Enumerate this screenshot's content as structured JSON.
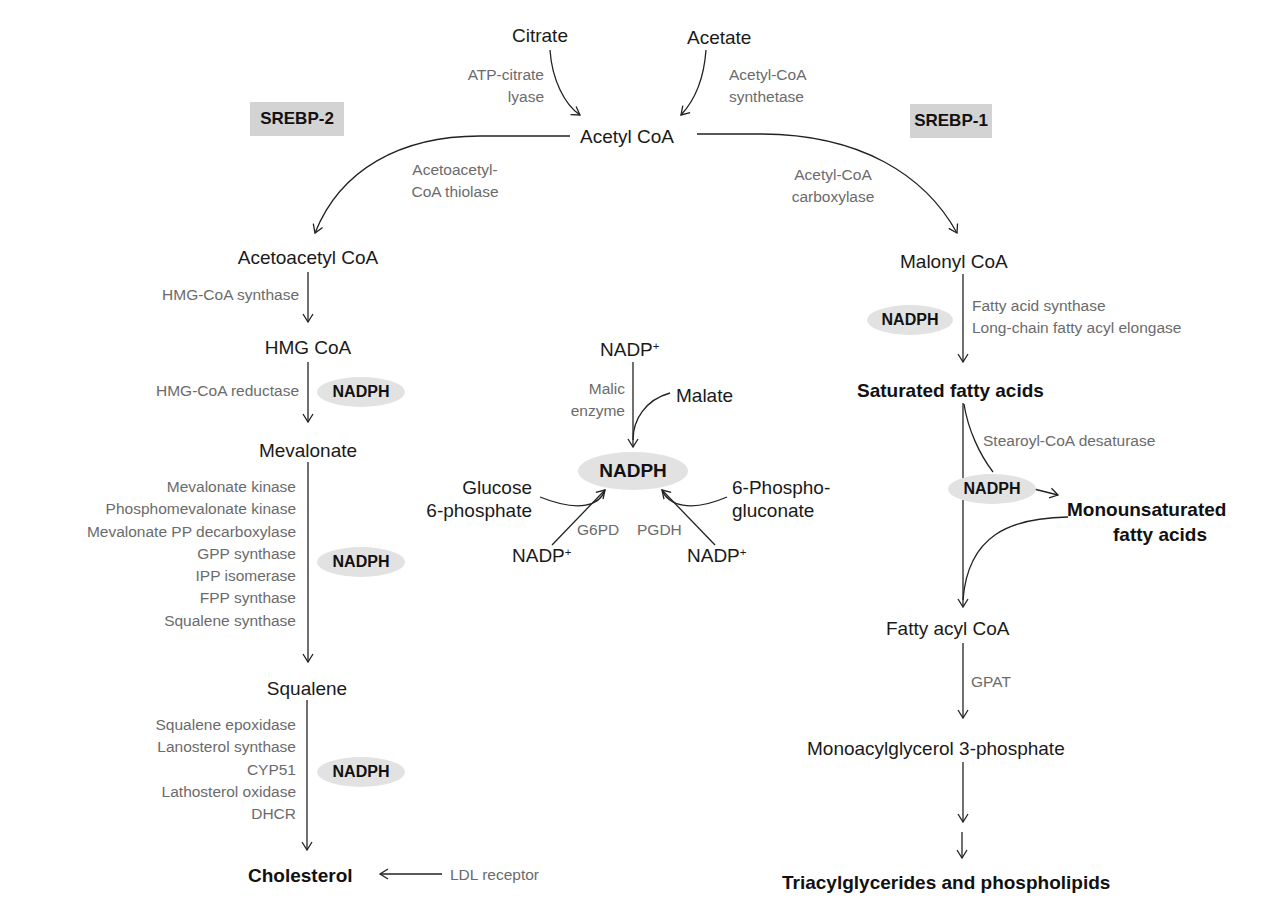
{
  "regulators": {
    "srebp2": "SREBP-2",
    "srebp1": "SREBP-1"
  },
  "top": {
    "citrate": "Citrate",
    "acetate": "Acetate",
    "atp_citrate_lyase": [
      "ATP-citrate",
      "lyase"
    ],
    "acetyl_coa_synthetase": [
      "Acetyl-CoA",
      "synthetase"
    ],
    "acetyl_coa": "Acetyl CoA"
  },
  "cholesterol_branch": {
    "thiolase": [
      "Acetoacetyl-",
      "CoA thiolase"
    ],
    "acetoacetyl_coa": "Acetoacetyl CoA",
    "hmg_coa_synthase": "HMG-CoA synthase",
    "hmg_coa": "HMG CoA",
    "hmg_coa_reductase": "HMG-CoA reductase",
    "nadph_1": "NADPH",
    "mevalonate": "Mevalonate",
    "mevalonate_enzymes": [
      "Mevalonate kinase",
      "Phosphomevalonate kinase",
      "Mevalonate PP decarboxylase",
      "GPP synthase",
      "IPP isomerase",
      "FPP synthase",
      "Squalene synthase"
    ],
    "nadph_2": "NADPH",
    "squalene": "Squalene",
    "squalene_enzymes": [
      "Squalene epoxidase",
      "Lanosterol synthase",
      "CYP51",
      "Lathosterol oxidase",
      "DHCR"
    ],
    "nadph_3": "NADPH",
    "cholesterol": "Cholesterol",
    "ldl_receptor": "LDL receptor"
  },
  "nadph_center": {
    "nadp_top": "NADP",
    "plus": "+",
    "malic_enzyme": [
      "Malic",
      "enzyme"
    ],
    "malate": "Malate",
    "nadph": "NADPH",
    "glucose_6p": [
      "Glucose",
      "6-phosphate"
    ],
    "phosphogluconate": [
      "6-Phospho-",
      "gluconate"
    ],
    "g6pd": "G6PD",
    "pgdh": "PGDH",
    "nadp_left": "NADP",
    "nadp_right": "NADP"
  },
  "fatty_acid_branch": {
    "acc": [
      "Acetyl-CoA",
      "carboxylase"
    ],
    "malonyl_coa": "Malonyl CoA",
    "nadph_1": "NADPH",
    "fas_enzymes": [
      "Fatty acid synthase",
      "Long-chain fatty acyl elongase"
    ],
    "saturated": "Saturated fatty acids",
    "scd": "Stearoyl-CoA desaturase",
    "nadph_2": "NADPH",
    "monounsaturated": [
      "Monounsaturated",
      "fatty acids"
    ],
    "fatty_acyl_coa": "Fatty acyl CoA",
    "gpat": "GPAT",
    "mag3p": "Monoacylglycerol 3-phosphate",
    "final": "Triacylglycerides and phospholipids"
  },
  "colors": {
    "metabolite": "#1a1a1a",
    "enzyme": "#6b6b6b",
    "highlight_box": "#d3d3d3",
    "nadph_ellipse": "#e2e2e2",
    "line": "#222222"
  }
}
